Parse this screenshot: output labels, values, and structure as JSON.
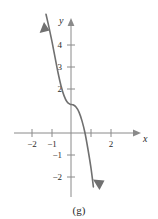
{
  "figure": {
    "caption": "(g)",
    "curve_color": "#707070",
    "axis_color": "#8a8a8a",
    "text_color": "#2b2b2b",
    "background": "#ffffff"
  },
  "axes": {
    "x_name": "x",
    "y_name": "y",
    "x_ticks": [
      {
        "value": -2,
        "label": "−2",
        "px": 32
      },
      {
        "value": -1,
        "label": "−1",
        "px": 52
      },
      {
        "value": 1,
        "label": "",
        "px": 91
      },
      {
        "value": 2,
        "label": "2",
        "px": 111
      }
    ],
    "y_ticks": [
      {
        "value": 4,
        "label": "4",
        "px": 45
      },
      {
        "value": 3,
        "label": "3",
        "px": 67
      },
      {
        "value": 2,
        "label": "2",
        "px": 89
      },
      {
        "value": -1,
        "label": "−1",
        "px": 155
      },
      {
        "value": -2,
        "label": "−2",
        "px": 177
      }
    ]
  },
  "chart_data": {
    "type": "line",
    "title": "",
    "xlabel": "x",
    "ylabel": "y",
    "xlim": [
      -2.9,
      3.9
    ],
    "ylim": [
      -2.7,
      5.2
    ],
    "grid": false,
    "legend": null,
    "series": [
      {
        "name": "decreasing cubic with inflection",
        "description": "y = 1.3 - 2.6*x^3 : strictly decreasing, flat inflection near x = 0, y = 1.3, crosses x-axis near x = 0.8",
        "arrow_start": "up-left",
        "arrow_end": "down-right",
        "x": [
          -1.25,
          -1.1,
          -0.95,
          -0.8,
          -0.65,
          -0.5,
          -0.35,
          -0.2,
          -0.05,
          0.1,
          0.25,
          0.4,
          0.55,
          0.7,
          0.85,
          1.0,
          1.12
        ],
        "y": [
          5.4,
          4.8,
          4.15,
          3.45,
          2.75,
          2.15,
          1.7,
          1.42,
          1.31,
          1.28,
          1.18,
          0.95,
          0.55,
          0.0,
          -0.75,
          -1.6,
          -2.45
        ]
      }
    ],
    "annotations": [
      {
        "text": "(g)",
        "position": "bottom-center"
      }
    ]
  }
}
